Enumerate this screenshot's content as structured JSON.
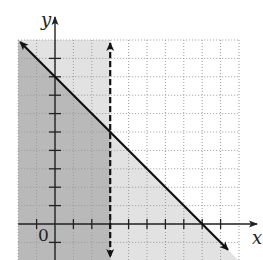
{
  "figure": {
    "x_axis_label": "x",
    "y_axis_label": "y",
    "origin_label": "0",
    "colors": {
      "background": "#ffffff",
      "dark_shade": "#b9b9b9",
      "light_shade": "#e2e2e2",
      "grid": "#9a9a9a",
      "axis": "#222222",
      "line": "#111111"
    }
  },
  "chart_data": {
    "type": "inequality-graph",
    "grid": {
      "xmin": -2,
      "xmax": 10,
      "ymin": -2,
      "ymax": 10,
      "step": 1
    },
    "lines": [
      {
        "equation": "x + y = 8",
        "style": "solid",
        "points": [
          [
            -2,
            10
          ],
          [
            10,
            -2
          ]
        ],
        "x_intercept": 8,
        "y_intercept": 8
      },
      {
        "equation": "x = 3",
        "style": "dashed",
        "points": [
          [
            3,
            10
          ],
          [
            3,
            -2
          ]
        ]
      }
    ],
    "shaded_regions": [
      {
        "description": "x < 3",
        "shade": "light"
      },
      {
        "description": "x + y <= 8",
        "shade": "light"
      },
      {
        "description": "x < 3 and x + y <= 8 (overlap)",
        "shade": "dark"
      }
    ],
    "x_ticks": [
      -1,
      1,
      2,
      3,
      4,
      5,
      6,
      7,
      8,
      9
    ],
    "y_ticks": [
      -1,
      1,
      2,
      3,
      4,
      5,
      6,
      7,
      8,
      9
    ]
  }
}
